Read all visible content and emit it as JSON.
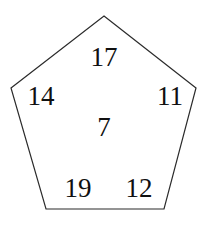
{
  "figure": {
    "name": "pentagon-number-diagram",
    "background_color": "#ffffff",
    "shape": {
      "name": "pentagon",
      "sides": 5,
      "stroke_color": "#2b2b2b",
      "fill_color": "#ffffff",
      "stroke_width": 1.2,
      "vertices": [
        {
          "name": "top",
          "x": 104,
          "y": 16
        },
        {
          "name": "right",
          "x": 196,
          "y": 88
        },
        {
          "name": "bottom-right",
          "x": 164,
          "y": 209
        },
        {
          "name": "bottom-left",
          "x": 46,
          "y": 209
        },
        {
          "name": "left",
          "x": 11,
          "y": 88
        }
      ]
    },
    "labels": [
      {
        "id": "top",
        "value": "17",
        "x": 104,
        "y": 57
      },
      {
        "id": "left",
        "value": "14",
        "x": 41,
        "y": 96
      },
      {
        "id": "right",
        "value": "11",
        "x": 170,
        "y": 96
      },
      {
        "id": "center",
        "value": "7",
        "x": 104,
        "y": 127
      },
      {
        "id": "bottom-left",
        "value": "19",
        "x": 78,
        "y": 188
      },
      {
        "id": "bottom-right",
        "value": "12",
        "x": 139,
        "y": 188
      }
    ]
  },
  "chart_data": {
    "type": "diagram",
    "title": "",
    "shape": "pentagon",
    "categories": [
      "top",
      "left",
      "right",
      "center",
      "bottom-left",
      "bottom-right"
    ],
    "values": [
      17,
      14,
      11,
      7,
      19,
      12
    ],
    "labels": [
      "17",
      "14",
      "11",
      "7",
      "19",
      "12"
    ],
    "xlabel": "",
    "ylabel": "",
    "grid": false,
    "legend": "none"
  }
}
